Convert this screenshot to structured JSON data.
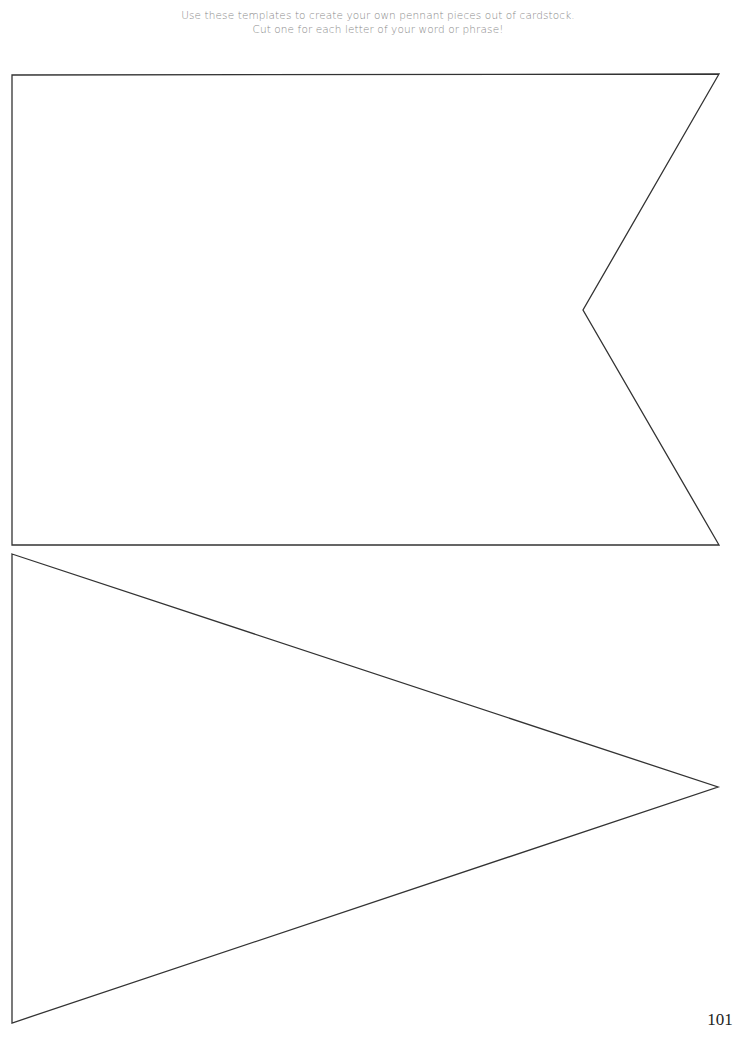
{
  "instructions": {
    "line1": "Use these templates to create your own pennant pieces out of cardstock.",
    "line2": "Cut one for each letter of your word or phrase!"
  },
  "templates": [
    {
      "name": "swallowtail-flag-pennant",
      "shape": "flag with notched end",
      "points": "12,75 719,74 583,310 719,545 12,545",
      "stroke": "#333333"
    },
    {
      "name": "triangle-pennant",
      "shape": "triangle",
      "points": "12,554 718,787 12,1023",
      "stroke": "#333333"
    }
  ],
  "footer": {
    "page_number": "101"
  }
}
